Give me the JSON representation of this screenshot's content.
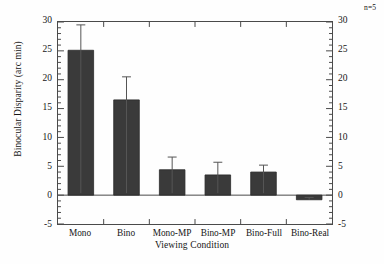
{
  "chart_data": {
    "type": "bar",
    "title": "",
    "xlabel": "Viewing Condition",
    "ylabel": "Binocular Disparity (arc min)",
    "y2label": "Equivalent Disparity (arc min)",
    "categories": [
      "Mono",
      "Bino",
      "Mono-MP",
      "Bino-MP",
      "Bino-Full",
      "Bino-Real"
    ],
    "values": [
      25.1,
      16.5,
      4.4,
      3.5,
      4.0,
      -0.8
    ],
    "errors": [
      4.4,
      4.0,
      2.2,
      2.2,
      1.2,
      0.4
    ],
    "ylim": [
      -5,
      30
    ],
    "y2lim": [
      -5,
      30
    ],
    "yticks": [
      -5,
      0,
      5,
      10,
      15,
      20,
      25,
      30
    ],
    "ytick_labels": [
      "-5",
      "0",
      "5",
      "10",
      "15",
      "20",
      "25",
      "30"
    ],
    "y2ticks": [
      -5,
      0,
      5,
      10,
      15,
      20,
      25,
      30
    ],
    "y2tick_labels": [
      "-5",
      "0",
      "5",
      "10",
      "15",
      "20",
      "25",
      "30"
    ],
    "minor_ticks_per_interval": 5,
    "grid": false,
    "legend": null,
    "annotation": "n=5",
    "bar_color": "#3a3a3a",
    "bar_edge_color": "#2a2a2a",
    "error_color": "#555555",
    "axis_color": "#4a4a4a"
  }
}
